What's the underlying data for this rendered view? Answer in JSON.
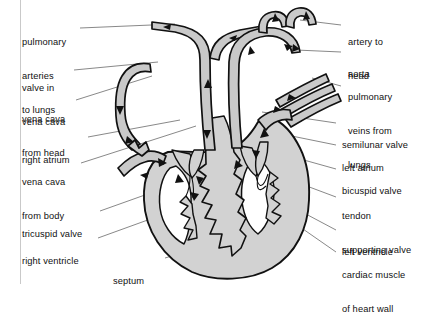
{
  "figure": {
    "colors": {
      "chamber_fill": "#d2d2d2",
      "vessel_fill": "#c9c9c9",
      "outline": "#111111",
      "leader_line": "#555555",
      "text": "#111111",
      "background": "#ffffff",
      "frame": "#c9c9c9"
    }
  },
  "labels_left": [
    {
      "id": "pulmonary-arteries-to-lungs",
      "lines": [
        "pulmonary",
        "arteries",
        "to lungs"
      ],
      "text": "pulmonary arteries to lungs"
    },
    {
      "id": "valve-in-vena-cava",
      "lines": [
        "valve in",
        "vena cava"
      ],
      "text": "valve in vena cava"
    },
    {
      "id": "vena-cava-from-head",
      "lines": [
        "vena cava",
        "from head"
      ],
      "text": "vena cava from head"
    },
    {
      "id": "right-atrium",
      "lines": [
        "right atrium"
      ],
      "text": "right atrium"
    },
    {
      "id": "vena-cava-from-body",
      "lines": [
        "vena cava",
        "from body"
      ],
      "text": "vena cava from body"
    },
    {
      "id": "tricuspid-valve",
      "lines": [
        "tricuspid valve"
      ],
      "text": "tricuspid valve"
    },
    {
      "id": "right-ventricle",
      "lines": [
        "right ventricle"
      ],
      "text": "right ventricle"
    }
  ],
  "labels_right": [
    {
      "id": "artery-to-head",
      "lines": [
        "artery to",
        "head"
      ],
      "text": "artery to head"
    },
    {
      "id": "aorta",
      "lines": [
        "aorta"
      ],
      "text": "aorta"
    },
    {
      "id": "pulmonary-veins-from-lungs",
      "lines": [
        "pulmonary",
        "veins from",
        "lungs"
      ],
      "text": "pulmonary veins from lungs"
    },
    {
      "id": "semilunar-valve",
      "lines": [
        "semilunar valve"
      ],
      "text": "semilunar valve"
    },
    {
      "id": "left-atrium",
      "lines": [
        "left atrium"
      ],
      "text": "left atrium"
    },
    {
      "id": "bicuspid-valve",
      "lines": [
        "bicuspid valve"
      ],
      "text": "bicuspid valve"
    },
    {
      "id": "tendon-supporting-valve",
      "lines": [
        "tendon",
        "supporting valve"
      ],
      "text": "tendon supporting valve"
    },
    {
      "id": "left-ventricle",
      "lines": [
        "left ventricle"
      ],
      "text": "left ventricle"
    },
    {
      "id": "cardiac-muscle-of-heart-wall",
      "lines": [
        "cardiac muscle",
        "of heart wall"
      ],
      "text": "cardiac muscle of heart wall"
    }
  ],
  "labels_bottom": [
    {
      "id": "septum",
      "lines": [
        "septum"
      ],
      "text": "septum"
    }
  ],
  "flow_arrows": {
    "description": "Black solid triangular arrowheads indicating direction of blood flow through vessels and chambers",
    "count": 22
  }
}
